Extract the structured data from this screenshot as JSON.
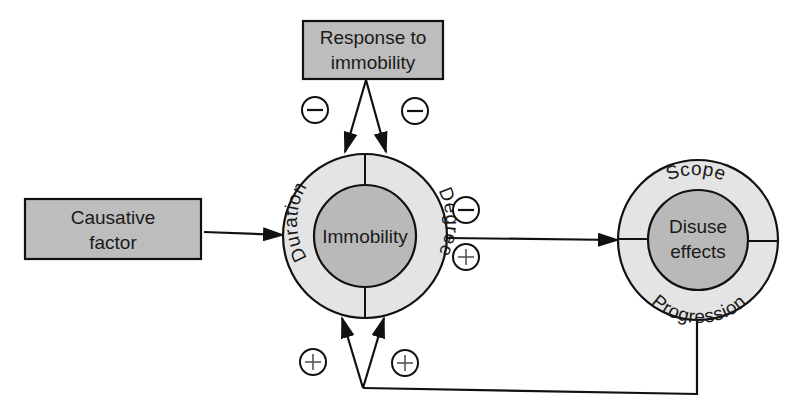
{
  "diagram": {
    "colors": {
      "box_fill": "#bdbdbd",
      "ring_fill": "#e4e4e4",
      "core_fill": "#b9b9b9",
      "stroke": "#111111",
      "background": "#ffffff"
    },
    "nodes": {
      "response": {
        "line1": "Response to",
        "line2": "immobility"
      },
      "causative": {
        "line1": "Causative",
        "line2": "factor"
      },
      "immobility": {
        "core": "Immobility",
        "ring_left": "Duration",
        "ring_right": "Degree"
      },
      "disuse": {
        "core_line1": "Disuse",
        "core_line2": "effects",
        "ring_top": "Scope",
        "ring_bottom": "Progression"
      }
    },
    "signs": {
      "response_left": "−",
      "response_right": "−",
      "output_top": "−",
      "output_bottom": "+",
      "feedback_left": "+",
      "feedback_right": "+"
    },
    "edges": [
      {
        "from": "Causative factor",
        "to": "Immobility"
      },
      {
        "from": "Response to immobility",
        "to": "Immobility (Duration)",
        "sign": "−"
      },
      {
        "from": "Response to immobility",
        "to": "Immobility (Degree)",
        "sign": "−"
      },
      {
        "from": "Immobility",
        "to": "Disuse effects",
        "sign": "−/+"
      },
      {
        "from": "Disuse effects",
        "to": "Immobility (Duration)",
        "sign": "+"
      },
      {
        "from": "Disuse effects",
        "to": "Immobility (Degree)",
        "sign": "+"
      }
    ]
  }
}
